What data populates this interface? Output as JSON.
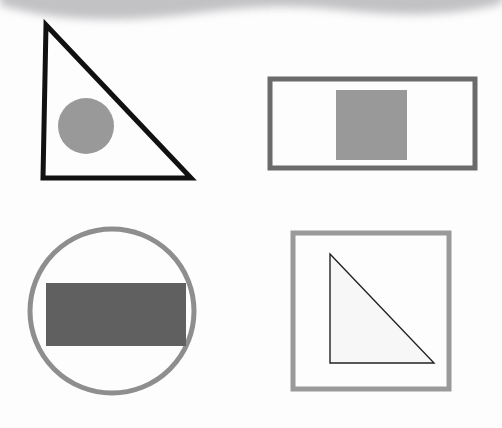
{
  "canvas": {
    "width": 502,
    "height": 428,
    "background": "#fdfdfd"
  },
  "palette": {
    "black": "#111111",
    "medium_gray": "#999999",
    "dark_gray": "#606060",
    "border_gray": "#6b6b6b",
    "light_gray": "#8e8e8e",
    "square_border_gray": "#9a9a9a",
    "near_white": "#f7f7f7",
    "wave_gray": "#b8b8bc"
  },
  "decoration": {
    "top_wave": {
      "name": "top-edge-wave-band",
      "fill": "#b8b8bc",
      "blur": 4,
      "opacity": 0.85,
      "path": "M 0 -12 L 502 -12 L 502 4 C 440 18 400 16 330 9 C 250 1 200 16 130 19 C 70 21 30 14 0 5 Z"
    }
  },
  "chart_data": {
    "type": "diagram",
    "layout": "2x2 grid of shape pairs on a white background",
    "shapes": [
      {
        "id": "top-left",
        "quadrant": "top-left",
        "outer": {
          "kind": "triangle",
          "orientation": "right-triangle, right angle at bottom-left",
          "points": "46,25 43,178 191,178",
          "stroke": "#111111",
          "stroke_width": 5,
          "fill": "none"
        },
        "inner": {
          "kind": "circle",
          "cx": 86,
          "cy": 126,
          "r": 28,
          "fill": "#999999",
          "stroke": "none"
        }
      },
      {
        "id": "top-right",
        "quadrant": "top-right",
        "outer": {
          "kind": "rectangle",
          "x": 270,
          "y": 79,
          "width": 205,
          "height": 89,
          "stroke": "#6b6b6b",
          "stroke_width": 5,
          "fill": "none"
        },
        "inner": {
          "kind": "square",
          "x": 336,
          "y": 90,
          "width": 71,
          "height": 70,
          "fill": "#999999",
          "stroke": "none"
        }
      },
      {
        "id": "bottom-left",
        "quadrant": "bottom-left",
        "outer": {
          "kind": "circle",
          "cx": 112,
          "cy": 311,
          "r": 82,
          "stroke": "#8e8e8e",
          "stroke_width": 5,
          "fill": "none"
        },
        "inner": {
          "kind": "rectangle",
          "x": 46,
          "y": 283,
          "width": 140,
          "height": 63,
          "fill": "#606060",
          "stroke": "none"
        }
      },
      {
        "id": "bottom-right",
        "quadrant": "bottom-right",
        "outer": {
          "kind": "square",
          "x": 293,
          "y": 233,
          "width": 156,
          "height": 156,
          "stroke": "#9a9a9a",
          "stroke_width": 5,
          "fill": "none"
        },
        "inner": {
          "kind": "triangle",
          "orientation": "right-triangle, right angle at bottom-left",
          "points": "330,254 330,363 434,363",
          "stroke": "#222222",
          "stroke_width": 1.4,
          "fill": "#f7f7f7"
        }
      }
    ]
  }
}
